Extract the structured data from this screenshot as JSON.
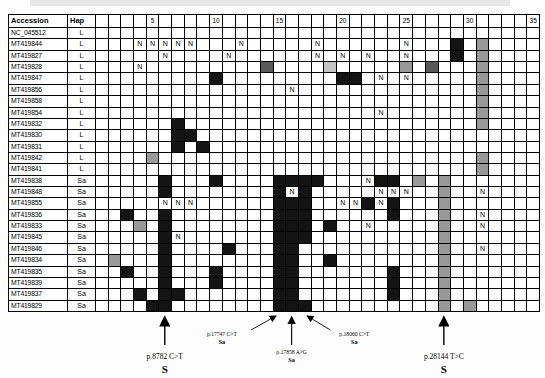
{
  "colors": {
    "black_cell": "#141414",
    "gray_cell": "#999999",
    "dark_gray_cell": "#5a5a5a",
    "light_gray_cell": "#c4c4c4",
    "grid_line": "#000000"
  },
  "legend_codes": {
    "B": "black substitution",
    "G": "gray ambiguous",
    "DG": "dark-gray",
    "LG": "light-gray",
    "N": "N call"
  },
  "table": {
    "header": {
      "accession": "Accession",
      "hap": "Hap"
    },
    "col_count": 35,
    "col_labels": {
      "5": "5",
      "10": "10",
      "15": "15",
      "20": "20",
      "25": "25",
      "30": "30",
      "35": "35"
    },
    "rows": [
      {
        "accession": "NC_045512",
        "hap": "L",
        "seq": "C",
        "cells": {}
      },
      {
        "accession": "MT419844",
        "hap": "L",
        "seq": "N",
        "cells": {
          "4": "N",
          "5": "N",
          "6": "N",
          "7": "N",
          "8": "N",
          "12": "N",
          "18": "N",
          "25": "N",
          "29": "B",
          "31": "G"
        }
      },
      {
        "accession": "MT419827",
        "hap": "L",
        "seq": "C",
        "cells": {
          "6": "N",
          "11": "N",
          "18": "N",
          "20": "N",
          "22": "N",
          "25": "N",
          "29": "B",
          "31": "G"
        }
      },
      {
        "accession": "MT419828",
        "hap": "L",
        "seq": "N",
        "cells": {
          "4": "N",
          "14": "DG",
          "19": "LG",
          "25": "G",
          "27": "DG",
          "31": "G"
        }
      },
      {
        "accession": "MT419847",
        "hap": "L",
        "seq": "C",
        "cells": {
          "10": "B",
          "20": "B",
          "21": "B",
          "23": "N",
          "25": "N",
          "31": "G"
        }
      },
      {
        "accession": "MT419856",
        "hap": "L",
        "seq": "C",
        "cells": {
          "16": "N",
          "31": "G"
        }
      },
      {
        "accession": "MT419858",
        "hap": "L",
        "seq": "C",
        "cells": {
          "31": "G"
        }
      },
      {
        "accession": "MT419854",
        "hap": "L",
        "seq": "C",
        "cells": {
          "23": "N",
          "31": "G"
        }
      },
      {
        "accession": "MT419832",
        "hap": "L",
        "seq": "C",
        "cells": {
          "7": "B",
          "31": "G"
        }
      },
      {
        "accession": "MT419830",
        "hap": "L",
        "seq": "C",
        "cells": {
          "7": "B",
          "8": "B"
        }
      },
      {
        "accession": "MT419831",
        "hap": "L",
        "seq": "C",
        "cells": {
          "7": "B",
          "9": "B"
        }
      },
      {
        "accession": "MT419842",
        "hap": "L",
        "seq": "C",
        "cells": {
          "5": "G",
          "31": "G"
        }
      },
      {
        "accession": "MT419841",
        "hap": "L",
        "seq": "C",
        "cells": {
          "31": "G"
        }
      },
      {
        "accession": "MT419838",
        "hap": "Sa",
        "seq": "N",
        "cells": {
          "6": "B",
          "10": "B",
          "15": "B",
          "16": "B",
          "17": "B",
          "18": "B",
          "22": "N",
          "23": "B",
          "24": "B",
          "26": "G",
          "28": "G"
        }
      },
      {
        "accession": "MT419848",
        "hap": "Sa",
        "seq": "C",
        "cells": {
          "6": "B",
          "15": "B",
          "16": "N",
          "17": "B",
          "23": "N",
          "24": "N",
          "25": "N",
          "28": "G",
          "31": "N"
        }
      },
      {
        "accession": "MT419855",
        "hap": "Sa",
        "seq": "C",
        "cells": {
          "6": "N",
          "7": "N",
          "8": "N",
          "15": "B",
          "16": "B",
          "17": "B",
          "20": "N",
          "21": "N",
          "22": "B",
          "23": "N",
          "24": "B",
          "28": "G"
        }
      },
      {
        "accession": "MT419836",
        "hap": "Sa",
        "seq": "C",
        "cells": {
          "3": "B",
          "6": "B",
          "15": "B",
          "16": "B",
          "17": "B",
          "24": "B",
          "28": "G",
          "31": "N"
        }
      },
      {
        "accession": "MT419833",
        "hap": "Sa",
        "seq": "C",
        "cells": {
          "4": "G",
          "6": "B",
          "15": "B",
          "16": "B",
          "17": "B",
          "19": "B",
          "22": "N",
          "28": "G",
          "31": "N"
        }
      },
      {
        "accession": "MT419845",
        "hap": "Sa",
        "seq": "C",
        "cells": {
          "6": "B",
          "7": "N",
          "15": "B",
          "16": "B",
          "17": "B",
          "28": "G"
        }
      },
      {
        "accession": "MT419846",
        "hap": "Sa",
        "seq": "C",
        "cells": {
          "6": "B",
          "11": "B",
          "15": "B",
          "16": "B",
          "28": "G",
          "31": "N"
        }
      },
      {
        "accession": "MT419834",
        "hap": "Sa",
        "seq": "C",
        "cells": {
          "2": "G",
          "6": "B",
          "15": "B",
          "16": "B",
          "19": "B",
          "28": "G"
        }
      },
      {
        "accession": "MT419835",
        "hap": "Sa",
        "seq": "C",
        "cells": {
          "3": "B",
          "6": "B",
          "10": "B",
          "15": "B",
          "16": "B",
          "24": "B",
          "28": "G"
        }
      },
      {
        "accession": "MT419839",
        "hap": "Sa",
        "seq": "C",
        "cells": {
          "6": "B",
          "10": "B",
          "15": "B",
          "16": "B",
          "24": "B",
          "28": "G"
        }
      },
      {
        "accession": "MT419837",
        "hap": "Sa",
        "seq": "C",
        "cells": {
          "4": "B",
          "6": "B",
          "7": "B",
          "15": "B",
          "16": "B",
          "24": "B",
          "28": "G"
        }
      },
      {
        "accession": "MT419829",
        "hap": "Sa",
        "seq": "C",
        "cells": {
          "5": "B",
          "6": "B",
          "15": "B",
          "16": "B",
          "17": "B",
          "28": "G",
          "30": "G"
        }
      }
    ]
  },
  "annotations": [
    {
      "label": "p.8782 C>T",
      "sub": "S",
      "col": 6,
      "type": "vertical",
      "size": "large"
    },
    {
      "label": "p.17747 C>T",
      "sub": "Sa",
      "col": 15,
      "type": "diag-right",
      "size": "small"
    },
    {
      "label": "p.17858 A>G",
      "sub": "Sa",
      "col": 16,
      "type": "vertical-small",
      "size": "small"
    },
    {
      "label": "p.18060 C>T",
      "sub": "Sa",
      "col": 17,
      "type": "diag-left",
      "size": "small"
    },
    {
      "label": "p.28144 T>C",
      "sub": "S",
      "col": 28,
      "type": "vertical",
      "size": "large"
    }
  ],
  "chart_data": {
    "type": "heatmap",
    "x_axis_ticks": [
      "5",
      "10",
      "15",
      "20",
      "25",
      "30",
      "35"
    ],
    "row_label_columns": [
      "Accession",
      "Hap"
    ],
    "cell_codes": {
      "B": "black substitution",
      "G": "gray",
      "DG": "dark gray",
      "LG": "light gray",
      "N": "ambiguous base N"
    },
    "note": "matrix identical to table.rows; 35 genome-bin columns per accession",
    "annotated_variants": [
      {
        "variant": "p.8782 C>T",
        "clade": "S",
        "column": 6
      },
      {
        "variant": "p.17747 C>T",
        "clade": "Sa",
        "column": 15
      },
      {
        "variant": "p.17858 A>G",
        "clade": "Sa",
        "column": 16
      },
      {
        "variant": "p.18060 C>T",
        "clade": "Sa",
        "column": 17
      },
      {
        "variant": "p.28144 T>C",
        "clade": "S",
        "column": 28
      }
    ]
  }
}
